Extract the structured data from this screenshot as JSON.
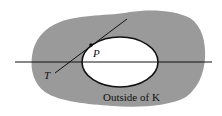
{
  "diagram": {
    "labels": {
      "point": "P",
      "tangent": "T",
      "region": "Outside of K"
    },
    "colors": {
      "region_fill": "#9a9a9a",
      "inner_fill": "#ffffff",
      "stroke": "#111111"
    }
  }
}
